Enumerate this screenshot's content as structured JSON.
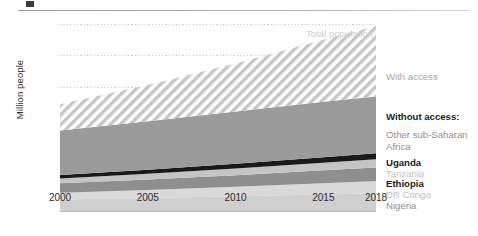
{
  "figure": {
    "marker": "figure-bullet",
    "ylabel": "Million people"
  },
  "chart_data": {
    "type": "area",
    "title": "",
    "subtitle": "",
    "xlabel": "",
    "ylabel": "Million people",
    "xlim": [
      2000,
      2018
    ],
    "ylim": [
      0,
      1200
    ],
    "grid": true,
    "legend_position": "right-inline",
    "xticks": [
      "2000",
      "2005",
      "2010",
      "2015",
      "2018"
    ],
    "xtick_values": [
      2000,
      2005,
      2010,
      2015,
      2018
    ],
    "yticks": [
      "200",
      "400",
      "600",
      "800",
      "1 000",
      "1 200"
    ],
    "ytick_values": [
      200,
      400,
      600,
      800,
      1000,
      1200
    ],
    "x": [
      2000,
      2005,
      2010,
      2015,
      2018
    ],
    "stack_order_bottom_to_top": [
      "Nigeria",
      "DR Congo",
      "Ethiopia",
      "Tanzania",
      "Uganda",
      "Other sub-Saharan Africa",
      "With access"
    ],
    "series": [
      {
        "name": "Nigeria",
        "color": "#cfcfcf",
        "values": [
          79,
          89,
          100,
          112,
          119
        ]
      },
      {
        "name": "DR Congo",
        "color": "#d9d9d9",
        "values": [
          44,
          52,
          61,
          72,
          79
        ]
      },
      {
        "name": "Ethiopia",
        "color": "#8e8e8e",
        "values": [
          60,
          67,
          74,
          82,
          86
        ]
      },
      {
        "name": "Tanzania",
        "color": "#c4c4c4",
        "values": [
          31,
          36,
          42,
          48,
          52
        ]
      },
      {
        "name": "Uganda",
        "color": "#1a1a1a",
        "values": [
          22,
          26,
          31,
          36,
          39
        ]
      },
      {
        "name": "Other sub-Saharan Africa",
        "color": "#9b9b9b",
        "values": [
          284,
          310,
          333,
          354,
          362
        ]
      },
      {
        "name": "With access",
        "color": "#f4f4f4",
        "values": [
          167,
          230,
          307,
          396,
          451
        ]
      }
    ],
    "totals": {
      "name": "Total population",
      "values": [
        687,
        810,
        948,
        1100,
        1188
      ]
    },
    "annotations": [
      {
        "name": "Total population",
        "style": "light-gray"
      },
      {
        "name": "With access",
        "style": "gray"
      },
      {
        "name": "Without access:",
        "style": "bold-dark"
      },
      {
        "name": "Other sub-Saharan Africa",
        "style": "gray"
      },
      {
        "name": "Uganda",
        "style": "bold-dark"
      },
      {
        "name": "Tanzania",
        "style": "light-gray"
      },
      {
        "name": "Ethiopia",
        "style": "bold-dark"
      },
      {
        "name": "DR Congo",
        "style": "light-gray"
      },
      {
        "name": "Nigeria",
        "style": "gray"
      }
    ]
  },
  "labels": {
    "total_population": "Total population",
    "with_access": "With access",
    "without_access": "Without access:",
    "other_sub_saharan": "Other sub-Saharan",
    "africa": "Africa",
    "uganda": "Uganda",
    "tanzania": "Tanzania",
    "ethiopia": "Ethiopia",
    "dr_congo": "DR Congo",
    "nigeria": "Nigeria"
  },
  "colors": {
    "nigeria": "#cfcfcf",
    "dr_congo": "#d9d9d9",
    "ethiopia": "#8e8e8e",
    "tanzania": "#c4c4c4",
    "uganda": "#1a1a1a",
    "other": "#9b9b9b",
    "with_access_hatch": "#bdbdbd",
    "gridline": "#c9c9c9",
    "axis": "#b5b5b5"
  }
}
